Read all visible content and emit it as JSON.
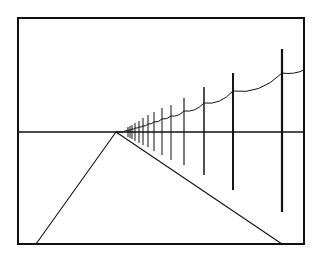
{
  "figure": {
    "colors": {
      "background": "#ffffff",
      "ink": "#111111"
    },
    "frame": {
      "x1": 18,
      "y1": 18,
      "x2": 304,
      "y2": 244
    },
    "horizon": {
      "y": 132,
      "x1": 18,
      "x2": 304
    },
    "vanishing_point": {
      "x": 116,
      "y": 132
    },
    "road": {
      "left_edge": {
        "x1": 116,
        "y1": 132,
        "x2": 36,
        "y2": 244
      },
      "right_edge": {
        "x1": 116,
        "y1": 132,
        "x2": 282,
        "y2": 244
      }
    },
    "poles": [
      {
        "x": 282,
        "top": 49,
        "bottom": 212,
        "wire_y": 73
      },
      {
        "x": 233,
        "top": 73,
        "bottom": 190,
        "wire_y": 91
      },
      {
        "x": 204,
        "top": 87,
        "bottom": 175,
        "wire_y": 103
      },
      {
        "x": 184,
        "top": 98,
        "bottom": 165,
        "wire_y": 111
      },
      {
        "x": 171,
        "top": 105,
        "bottom": 160,
        "wire_y": 116
      },
      {
        "x": 162,
        "top": 108,
        "bottom": 155,
        "wire_y": 119
      },
      {
        "x": 154,
        "top": 112,
        "bottom": 151,
        "wire_y": 122
      },
      {
        "x": 148,
        "top": 115,
        "bottom": 147,
        "wire_y": 124
      },
      {
        "x": 143,
        "top": 118,
        "bottom": 145,
        "wire_y": 126
      },
      {
        "x": 139,
        "top": 121,
        "bottom": 143,
        "wire_y": 127
      },
      {
        "x": 135,
        "top": 123,
        "bottom": 141,
        "wire_y": 128
      },
      {
        "x": 132,
        "top": 125,
        "bottom": 139,
        "wire_y": 129
      },
      {
        "x": 130,
        "top": 126,
        "bottom": 138,
        "wire_y": 130
      },
      {
        "x": 128,
        "top": 127,
        "bottom": 137,
        "wire_y": 130
      }
    ],
    "wire_end": {
      "x": 304,
      "y": 70
    }
  }
}
